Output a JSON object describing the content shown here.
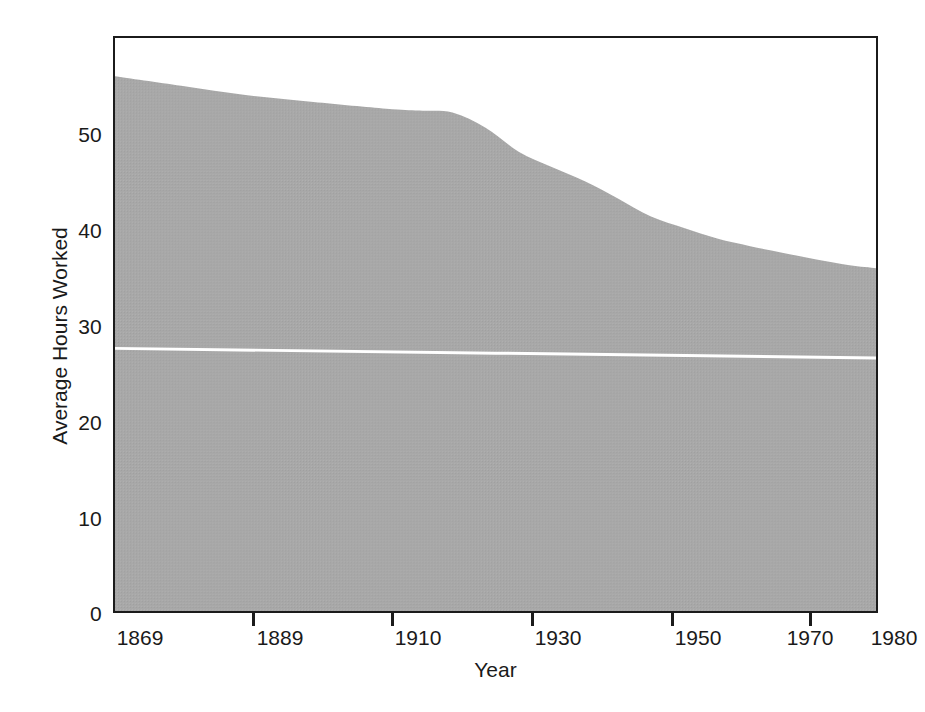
{
  "chart_data": {
    "type": "area",
    "title": "",
    "xlabel": "Year",
    "ylabel": "Average Hours Worked",
    "xlim": [
      1869,
      1984
    ],
    "ylim": [
      0,
      60
    ],
    "grid": false,
    "legend": "none",
    "area_fill_color": "#a8a8a8",
    "reference_line_color": "#ffffff",
    "axis_color": "#1b1b1b",
    "background_color": "#ffffff",
    "x_ticks": [
      {
        "value": 1869,
        "label": "1869"
      },
      {
        "value": 1889,
        "label": "1889"
      },
      {
        "value": 1910,
        "label": "1910"
      },
      {
        "value": 1930,
        "label": "1930"
      },
      {
        "value": 1950,
        "label": "1950"
      },
      {
        "value": 1970,
        "label": "1970"
      },
      {
        "value": 1980,
        "label": "1980"
      }
    ],
    "y_ticks": [
      {
        "value": 0,
        "label": "0"
      },
      {
        "value": 10,
        "label": "10"
      },
      {
        "value": 20,
        "label": "20"
      },
      {
        "value": 30,
        "label": "30"
      },
      {
        "value": 40,
        "label": "40"
      },
      {
        "value": 50,
        "label": "50"
      }
    ],
    "series": [
      {
        "name": "Average Hours Worked",
        "type": "area",
        "fill": "#a8a8a8",
        "x": [
          1869,
          1879,
          1889,
          1899,
          1910,
          1915,
          1920,
          1925,
          1930,
          1935,
          1940,
          1945,
          1950,
          1955,
          1960,
          1965,
          1970,
          1975,
          1980,
          1984
        ],
        "values": [
          56.0,
          55.0,
          54.0,
          53.3,
          52.6,
          52.4,
          52.2,
          50.6,
          48.1,
          46.5,
          45.0,
          43.2,
          41.3,
          40.1,
          39.0,
          38.2,
          37.5,
          36.8,
          36.2,
          35.9
        ]
      },
      {
        "name": "Reference line",
        "type": "line",
        "color": "#ffffff",
        "x": [
          1869,
          1984
        ],
        "values": [
          27.5,
          26.5
        ]
      }
    ]
  }
}
